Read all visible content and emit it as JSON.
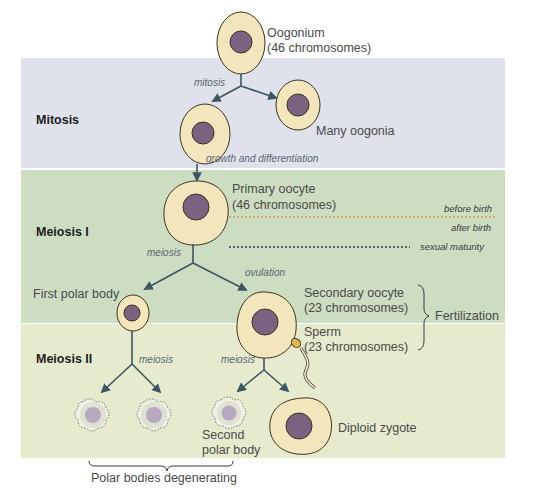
{
  "phases": {
    "mitosis": "Mitosis",
    "meiosis_1": "Meiosis I",
    "meiosis_2": "Meiosis II"
  },
  "cells": {
    "oogonium": {
      "name": "Oogonium",
      "detail": "(46 chromosomes)"
    },
    "many_oogonia": "Many oogonia",
    "primary_oocyte": {
      "name": "Primary oocyte",
      "detail": "(46 chromosomes)"
    },
    "first_polar_body": "First polar body",
    "secondary_oocyte": {
      "name": "Secondary oocyte",
      "detail": "(23 chromosomes)"
    },
    "sperm": {
      "name": "Sperm",
      "detail": "(23 chromosomes)"
    },
    "second_polar_body": {
      "line1": "Second",
      "line2": "polar body"
    },
    "diploid_zygote": "Diploid zygote"
  },
  "processes": {
    "mitosis": "mitosis",
    "growth": "growth and differentiation",
    "meiosis_1": "meiosis",
    "ovulation": "ovulation",
    "meiosis_2_left": "meiosis",
    "meiosis_2_right": "meiosis"
  },
  "timeline": {
    "before_birth": "before birth",
    "after_birth": "after birth",
    "sexual_maturity": "sexual maturity"
  },
  "brackets": {
    "fertilization": "Fertilization",
    "polar_bodies_degenerating": "Polar bodies degenerating"
  },
  "colors": {
    "mitosis_band": "#dfe2ea",
    "meiosis1_band": "#cdddc2",
    "meiosis2_band": "#e7ebcd",
    "cytoplasm": "#f4e6bc",
    "nucleus": "#7a6380",
    "arrow": "#3d5665",
    "dotted_orange": "#d4a24a",
    "dotted_dark": "#3a3a4a"
  }
}
